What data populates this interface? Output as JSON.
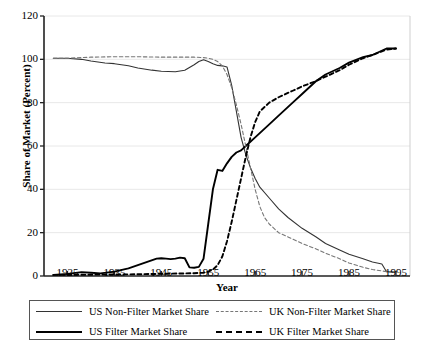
{
  "chart_data": {
    "type": "line",
    "title": "",
    "xlabel": "Year",
    "ylabel": "Share of Market (Percent)",
    "xlim": [
      1920,
      1998
    ],
    "ylim": [
      0,
      120
    ],
    "yticks": [
      0,
      20,
      40,
      60,
      80,
      100,
      120
    ],
    "xticks": [
      1925,
      1935,
      1945,
      1955,
      1965,
      1975,
      1985,
      1995
    ],
    "grid": true,
    "legend_position": "bottom",
    "series": [
      {
        "name": "US Non-Filter Market Share",
        "style": "solid-thin",
        "color": "#333333",
        "x": [
          1922,
          1925,
          1928,
          1930,
          1933,
          1935,
          1938,
          1940,
          1943,
          1945,
          1948,
          1950,
          1952,
          1953,
          1954,
          1955,
          1956,
          1957,
          1958,
          1959,
          1960,
          1961,
          1962,
          1963,
          1964,
          1965,
          1966,
          1968,
          1970,
          1972,
          1975,
          1978,
          1980,
          1983,
          1985,
          1988,
          1990,
          1992,
          1993,
          1995
        ],
        "y": [
          100.5,
          100.5,
          100.0,
          99.2,
          98.3,
          98.0,
          97.0,
          96.0,
          95.0,
          94.5,
          94.3,
          95.0,
          97.5,
          99.0,
          99.8,
          99.0,
          98.0,
          97.2,
          97.0,
          96.5,
          88.0,
          76.0,
          64.0,
          56.0,
          50.0,
          45.0,
          41.0,
          36.0,
          31.0,
          27.0,
          22.0,
          18.0,
          15.0,
          12.0,
          10.0,
          8.0,
          6.5,
          5.5,
          2.0,
          1.8
        ]
      },
      {
        "name": "US Filter Market Share",
        "style": "solid-thick",
        "color": "#000000",
        "x": [
          1922,
          1925,
          1928,
          1930,
          1932,
          1935,
          1938,
          1940,
          1942,
          1944,
          1945,
          1946,
          1947,
          1948,
          1949,
          1950,
          1951,
          1952,
          1953,
          1954,
          1955,
          1956,
          1957,
          1958,
          1959,
          1960,
          1961,
          1962,
          1963,
          1965,
          1968,
          1970,
          1973,
          1975,
          1978,
          1980,
          1983,
          1985,
          1988,
          1990,
          1993,
          1995
        ],
        "y": [
          0.5,
          1.0,
          1.8,
          1.5,
          1.2,
          2.0,
          3.5,
          5.0,
          6.5,
          8.0,
          8.2,
          8.0,
          7.8,
          8.0,
          8.5,
          8.2,
          4.0,
          3.8,
          4.2,
          8.0,
          24.0,
          40.0,
          49.0,
          48.5,
          52.0,
          55.0,
          57.0,
          58.0,
          60.0,
          64.0,
          70.0,
          74.0,
          80.0,
          84.0,
          90.0,
          93.0,
          96.0,
          98.5,
          101.0,
          102.0,
          105.0,
          105.0
        ]
      },
      {
        "name": "UK Non-Filter Market Share",
        "style": "dashed-thin",
        "color": "#777777",
        "x": [
          1922,
          1925,
          1928,
          1930,
          1935,
          1940,
          1945,
          1948,
          1950,
          1952,
          1954,
          1955,
          1956,
          1957,
          1958,
          1959,
          1960,
          1961,
          1962,
          1963,
          1964,
          1965,
          1966,
          1967,
          1968,
          1970,
          1972,
          1975,
          1978,
          1980,
          1983,
          1985,
          1988,
          1990,
          1993,
          1995
        ],
        "y": [
          100.5,
          100.5,
          100.8,
          101.0,
          101.2,
          101.2,
          101.0,
          101.0,
          101.0,
          101.0,
          100.8,
          100.5,
          100.0,
          99.0,
          97.0,
          93.0,
          87.0,
          79.0,
          70.0,
          60.0,
          50.0,
          40.0,
          32.0,
          27.0,
          24.0,
          20.0,
          18.0,
          15.0,
          12.5,
          10.5,
          8.0,
          6.0,
          4.0,
          3.0,
          2.0,
          1.5
        ]
      },
      {
        "name": "UK Filter Market Share",
        "style": "dashed-thick",
        "color": "#000000",
        "x": [
          1922,
          1930,
          1940,
          1945,
          1950,
          1952,
          1954,
          1955,
          1956,
          1957,
          1958,
          1959,
          1960,
          1961,
          1962,
          1963,
          1964,
          1965,
          1966,
          1968,
          1970,
          1973,
          1975,
          1978,
          1980,
          1983,
          1985,
          1988,
          1990,
          1993,
          1995
        ],
        "y": [
          0.5,
          0.6,
          0.8,
          1.0,
          1.2,
          1.3,
          1.5,
          2.0,
          3.0,
          5.0,
          9.0,
          16.0,
          25.0,
          35.0,
          45.0,
          55.0,
          64.0,
          71.0,
          76.0,
          80.0,
          82.5,
          85.5,
          87.5,
          90.0,
          92.0,
          95.0,
          97.5,
          100.5,
          102.0,
          104.5,
          105.0
        ]
      }
    ]
  },
  "axes": {
    "ylabel": "Share of Market (Percent)",
    "xlabel": "Year",
    "ytick_labels": [
      "0",
      "20",
      "40",
      "60",
      "80",
      "100",
      "120"
    ],
    "xtick_labels": [
      "1925",
      "1935",
      "1945",
      "1955",
      "1965",
      "1975",
      "1985",
      "1995"
    ]
  },
  "legend": {
    "entries": [
      {
        "label": "US Non-Filter Market Share",
        "swatch": "solid-thin-line"
      },
      {
        "label": "UK Non-Filter Market Share",
        "swatch": "dashed-thin-line"
      },
      {
        "label": "US Filter Market Share",
        "swatch": "solid-thick-line"
      },
      {
        "label": "UK Filter Market Share",
        "swatch": "dashed-thick-line"
      }
    ]
  },
  "colors": {
    "grid": "#e8e8e8",
    "axis": "#222222",
    "us_nonfilter": "#333333",
    "us_filter": "#000000",
    "uk_nonfilter": "#777777",
    "uk_filter": "#000000"
  }
}
